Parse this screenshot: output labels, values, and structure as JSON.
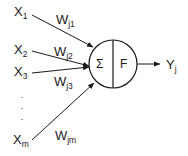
{
  "diagram": {
    "stroke_color": "#1a1a1a",
    "background_color": "#ffffff",
    "inputs": [
      {
        "base": "X",
        "sub": "1",
        "x": 14,
        "y": 3
      },
      {
        "base": "X",
        "sub": "2",
        "x": 14,
        "y": 41
      },
      {
        "base": "X",
        "sub": "3",
        "x": 14,
        "y": 63
      },
      {
        "base": "X",
        "sub": "m",
        "x": 13,
        "y": 131
      }
    ],
    "weights": [
      {
        "base": "W",
        "sub": "j1",
        "x": 56,
        "y": 11
      },
      {
        "base": "W",
        "sub": "j2",
        "x": 54,
        "y": 43
      },
      {
        "base": "W",
        "sub": "j3",
        "x": 54,
        "y": 73
      },
      {
        "base": "W",
        "sub": "jm",
        "x": 55,
        "y": 127
      }
    ],
    "node": {
      "summation_symbol": "Σ",
      "function_symbol": "F",
      "center_x": 113,
      "center_y": 64,
      "radius": 24
    },
    "output": {
      "base": "Y",
      "sub": "j",
      "x": 166,
      "y": 56
    },
    "ellipsis": "·"
  }
}
